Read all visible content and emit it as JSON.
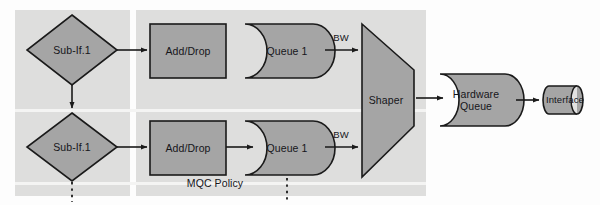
{
  "diagram": {
    "colors": {
      "panel_background": "#dededd",
      "shape_fill": "#a5a5a5",
      "shape_stroke": "#1a1a1a",
      "page_background": "#fdfdfd",
      "text": "#15151a",
      "seam": "#f4f4f3"
    },
    "panels": [
      {
        "name": "sub-interface-panel",
        "label": ""
      },
      {
        "name": "mqc-policy-panel",
        "label": "MQC Policy"
      }
    ],
    "nodes": {
      "subif_top": {
        "label": "Sub-If.1",
        "shape": "diamond"
      },
      "subif_bottom": {
        "label": "Sub-If.1",
        "shape": "diamond"
      },
      "adddrop_top": {
        "label": "Add/Drop",
        "shape": "rectangle"
      },
      "adddrop_bottom": {
        "label": "Add/Drop",
        "shape": "rectangle"
      },
      "queue_top": {
        "label": "Queue 1",
        "shape": "data-storage"
      },
      "queue_bottom": {
        "label": "Queue 1",
        "shape": "data-storage"
      },
      "shaper": {
        "label": "Shaper",
        "shape": "trapezoid"
      },
      "hardware_queue": {
        "label": "Hardware\nQueue",
        "shape": "data-storage"
      },
      "interface": {
        "label": "Interface",
        "shape": "cylinder"
      }
    },
    "edge_labels": {
      "bw_top": "BW",
      "bw_bottom": "BW"
    },
    "continuation_markers": [
      {
        "name": "subif-continuation",
        "style": "dotted-vertical"
      },
      {
        "name": "queue-continuation",
        "style": "dotted-vertical"
      }
    ]
  }
}
